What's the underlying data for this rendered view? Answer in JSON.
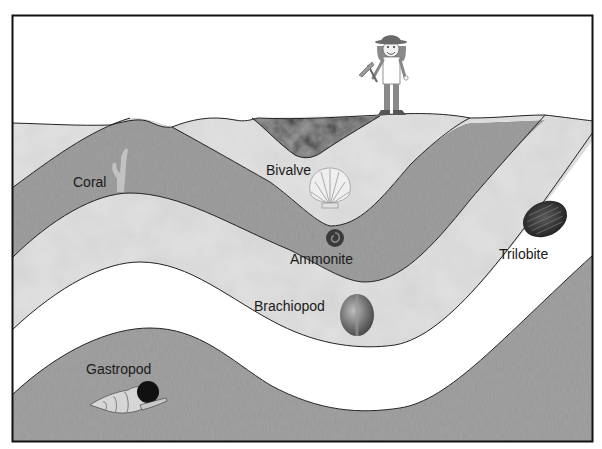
{
  "diagram": {
    "frame": {
      "x": 12,
      "y": 15,
      "width": 581,
      "height": 427
    },
    "colors": {
      "sky": "#ffffff",
      "light_layer": "#d9d9d9",
      "dark_layer": "#9a9a9a",
      "white_band": "#ffffff",
      "basin": "#3a3a3a",
      "outline": "#222222"
    },
    "fossils": [
      {
        "id": "coral",
        "label": "Coral",
        "label_x": 60,
        "label_y": 187
      },
      {
        "id": "bivalve",
        "label": "Bivalve",
        "label_x": 266,
        "label_y": 175
      },
      {
        "id": "ammonite",
        "label": "Ammonite",
        "label_x": 290,
        "label_y": 264
      },
      {
        "id": "trilobite",
        "label": "Trilobite",
        "label_x": 499,
        "label_y": 259
      },
      {
        "id": "brachiopod",
        "label": "Brachiopod",
        "label_x": 254,
        "label_y": 311
      },
      {
        "id": "gastropod",
        "label": "Gastropod",
        "label_x": 86,
        "label_y": 374
      }
    ],
    "figure": {
      "id": "geologist",
      "description": "Person with hat holding rock hammer standing on surface"
    }
  }
}
